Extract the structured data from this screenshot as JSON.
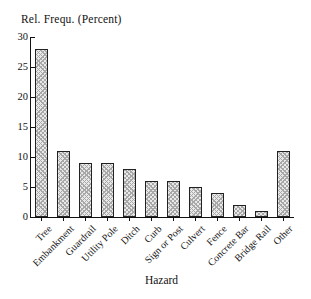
{
  "chart_data": {
    "type": "bar",
    "title": "Rel. Frequ. (Percent)",
    "xlabel": "Hazard",
    "ylabel": "",
    "categories": [
      "Tree",
      "Embankment",
      "Guardrail",
      "Utility Pole",
      "Ditch",
      "Curb",
      "Sign or Post",
      "Culvert",
      "Fence",
      "Concrete Bar",
      "Bridge Rail",
      "Other"
    ],
    "values": [
      28,
      11,
      9,
      9,
      8,
      6,
      6,
      5,
      4,
      2,
      1,
      11
    ],
    "ylim": [
      0,
      30
    ],
    "yticks": [
      0,
      5,
      10,
      15,
      20,
      25,
      30
    ],
    "grid": "off",
    "legend": "none",
    "bar_fill": "#e9e9e9",
    "bar_hatch_color": "#a8a8a8",
    "bar_border_color": "#222222",
    "axis_color": "#111111",
    "text_color": "#111111",
    "background_color": "#ffffff"
  }
}
